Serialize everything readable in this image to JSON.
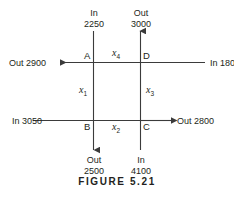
{
  "figure": {
    "caption": "FIGURE 5.21",
    "line_color": "#3b3b3b",
    "text_color": "#231f20",
    "background": "#ffffff"
  },
  "flows": {
    "top_left": {
      "direction": "In",
      "amount": "2250"
    },
    "top_right": {
      "direction": "Out",
      "amount": "3000"
    },
    "left_upper": {
      "label": "Out 2900"
    },
    "right_upper": {
      "label": "In 1800"
    },
    "left_lower": {
      "label": "In 3050"
    },
    "right_lower": {
      "label": "Out 2800"
    },
    "bottom_left": {
      "direction": "Out",
      "amount": "2500"
    },
    "bottom_right": {
      "direction": "In",
      "amount": "4100"
    }
  },
  "nodes": {
    "a": "A",
    "b": "B",
    "c": "C",
    "d": "D"
  },
  "variables": {
    "x1": {
      "base": "x",
      "sub": "1"
    },
    "x2": {
      "base": "x",
      "sub": "2"
    },
    "x3": {
      "base": "x",
      "sub": "3"
    },
    "x4": {
      "base": "x",
      "sub": "4"
    }
  }
}
